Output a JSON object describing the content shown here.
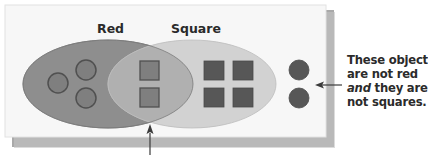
{
  "diagram": {
    "type": "venn",
    "sets": [
      {
        "id": "red",
        "label": "Red",
        "fill": "#8e8e8e",
        "stroke": "#7a7a7a"
      },
      {
        "id": "square",
        "label": "Square",
        "fill": "#d2d2d2",
        "stroke": "#bdbdbd"
      }
    ],
    "intersection_fill": "#b0b0b0",
    "regions": {
      "red_only": {
        "shape": "circle",
        "count": 3,
        "fill": "#7f7f7f",
        "stroke": "#505050"
      },
      "both": {
        "shape": "square",
        "count": 2,
        "fill": "#7f7f7f",
        "stroke": "#505050"
      },
      "square_only": {
        "shape": "square",
        "count": 4,
        "fill": "#575757",
        "stroke": "#4a4a4a"
      },
      "neither": {
        "shape": "circle",
        "count": 2,
        "fill": "#575757",
        "stroke": "#4a4a4a"
      }
    },
    "annotation": {
      "line1": "These objects",
      "line2": "are not red",
      "line3_em": "and",
      "line3_rest": " they are",
      "line4": "not squares."
    },
    "colors": {
      "panel": "#f7f7f7",
      "panel_shadow": "#a8a8a8",
      "arrow": "#3a3a3a"
    }
  }
}
